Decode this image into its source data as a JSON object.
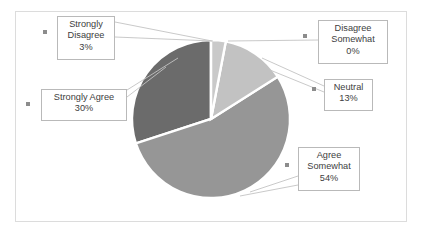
{
  "chart_data": {
    "type": "pie",
    "title": "",
    "categories": [
      "Strongly Disagree",
      "Disagree Somewhat",
      "Neutral",
      "Agree Somewhat",
      "Strongly Agree"
    ],
    "values": [
      3,
      0,
      13,
      54,
      30
    ],
    "value_labels": [
      "3%",
      "0%",
      "13%",
      "54%",
      "30%"
    ],
    "colors": [
      "#c9c9c9",
      "#b5b5b5",
      "#c2c2c2",
      "#969696",
      "#6b6b6b"
    ],
    "legend": "callout-labels",
    "units": "percent",
    "slice_separator_color": "#ffffff",
    "start_angle_deg": 0,
    "direction": "clockwise"
  },
  "frame": {
    "border_color": "#dcdcdc",
    "background": "#ffffff"
  },
  "labels": {
    "strongly_disagree": {
      "line1": "Strongly",
      "line2": "Disagree",
      "value": "3%"
    },
    "disagree_somewhat": {
      "line1": "Disagree",
      "line2": "Somewhat",
      "value": "0%"
    },
    "neutral": {
      "line1": "Neutral",
      "value": "13%"
    },
    "agree_somewhat": {
      "line1": "Agree",
      "line2": "Somewhat",
      "value": "54%"
    },
    "strongly_agree": {
      "line1": "Strongly Agree",
      "value": "30%"
    }
  }
}
